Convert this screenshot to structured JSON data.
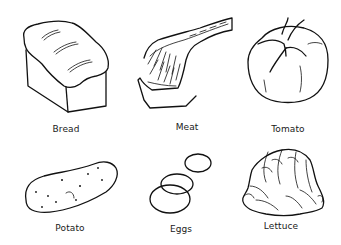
{
  "worksheet": {
    "items": [
      {
        "name": "Bread",
        "icon": "bread-icon"
      },
      {
        "name": "Meat",
        "icon": "meat-icon"
      },
      {
        "name": "Tomato",
        "icon": "tomato-icon"
      },
      {
        "name": "Potato",
        "icon": "potato-icon"
      },
      {
        "name": "Eggs",
        "icon": "eggs-icon"
      },
      {
        "name": "Lettuce",
        "icon": "lettuce-icon"
      }
    ],
    "colors": {
      "ink": "#111111",
      "background": "#ffffff"
    }
  }
}
